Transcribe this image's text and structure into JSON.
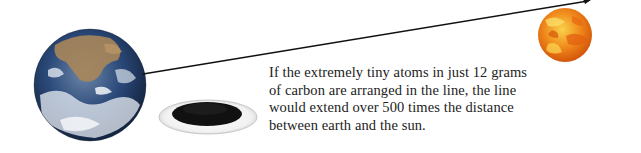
{
  "caption": {
    "lines": [
      "If the extremely tiny atoms in just 12 grams",
      "of carbon are arranged in the line, the line",
      "would extend over 500 times the distance",
      "between earth and the sun."
    ]
  },
  "figure": {
    "objects": [
      {
        "name": "earth",
        "icon": "earth-globe-icon"
      },
      {
        "name": "carbon-powder-dish",
        "icon": "carbon-dish-icon"
      },
      {
        "name": "sun",
        "icon": "sun-icon"
      },
      {
        "name": "distance-line",
        "icon": "arrow-line-icon"
      }
    ]
  },
  "colors": {
    "background": "#ffffff",
    "text": "#222222",
    "line": "#111111",
    "sun_base": "#f07a12",
    "sun_light": "#f7c63a",
    "earth_ocean": "#1e3a6b",
    "earth_land": "#a8865a",
    "carbon": "#111111",
    "dish": "#e8e8e8"
  }
}
